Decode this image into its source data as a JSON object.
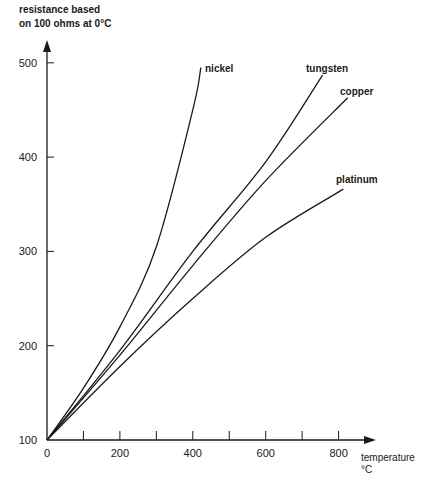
{
  "chart_data": {
    "type": "line",
    "title": "",
    "ylabel": "resistance based on 100 ohms at 0°C",
    "ylabel_lines": [
      "resistance based",
      "on 100 ohms at 0°C"
    ],
    "xlabel": "temperature °C",
    "xlabel_lines": [
      "temperature",
      "°C"
    ],
    "xlim": [
      0,
      900
    ],
    "ylim": [
      100,
      520
    ],
    "x_ticks": [
      0,
      100,
      200,
      300,
      400,
      500,
      600,
      700,
      800
    ],
    "x_tick_labels": [
      "0",
      "200",
      "400",
      "600",
      "800"
    ],
    "x_tick_label_values": [
      0,
      200,
      400,
      600,
      800
    ],
    "y_ticks": [
      100,
      200,
      300,
      400,
      500
    ],
    "y_tick_labels": [
      "100",
      "200",
      "300",
      "400",
      "500"
    ],
    "grid": false,
    "legend": "inline labels at line ends",
    "series": [
      {
        "name": "nickel",
        "x": [
          0,
          100,
          200,
          300,
          400,
          422
        ],
        "values": [
          100,
          155,
          220,
          305,
          450,
          495
        ]
      },
      {
        "name": "tungsten",
        "x": [
          0,
          200,
          400,
          600,
          756
        ],
        "values": [
          100,
          195,
          300,
          395,
          487
        ]
      },
      {
        "name": "copper",
        "x": [
          0,
          200,
          400,
          600,
          825
        ],
        "values": [
          100,
          190,
          285,
          375,
          463
        ]
      },
      {
        "name": "platinum",
        "x": [
          0,
          200,
          400,
          600,
          813
        ],
        "values": [
          100,
          178,
          250,
          315,
          366
        ]
      }
    ]
  }
}
